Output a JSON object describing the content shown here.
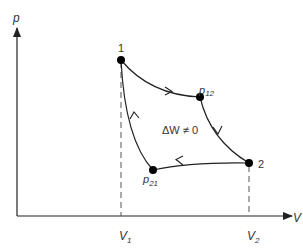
{
  "diagram": {
    "type": "pV-cycle",
    "axes": {
      "y_label": "p",
      "x_label": "V"
    },
    "points": [
      {
        "id": "1",
        "label": "1"
      },
      {
        "id": "p12",
        "label": "p",
        "subscript": "12"
      },
      {
        "id": "2",
        "label": "2"
      },
      {
        "id": "p21",
        "label": "p",
        "subscript": "21"
      }
    ],
    "volume_ticks": [
      {
        "label": "V",
        "subscript": "1"
      },
      {
        "label": "V",
        "subscript": "2"
      }
    ],
    "annotation": "ΔW ≠ 0",
    "colors": {
      "line": "#222222",
      "dashed": "#555555",
      "point": "#000000",
      "text": "#333333"
    }
  }
}
